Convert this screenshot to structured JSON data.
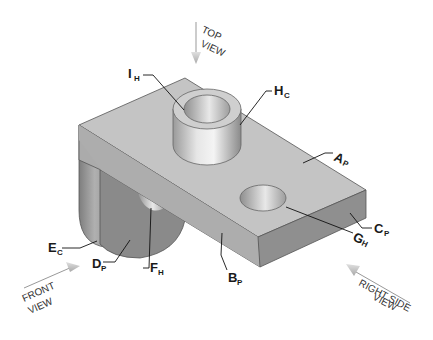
{
  "figure": {
    "view_arrows": {
      "top": {
        "line1": "TOP",
        "line2": "VIEW"
      },
      "front": {
        "line1": "FRONT",
        "line2": "VIEW"
      },
      "right_side": {
        "line1": "RIGHT SIDE",
        "line2": "VIEW"
      }
    },
    "labels": [
      {
        "id": "I_H",
        "main": "I",
        "sub": "H",
        "meaning": "inner hole of boss"
      },
      {
        "id": "H_C",
        "main": "H",
        "sub": "C",
        "meaning": "cylindrical boss surface"
      },
      {
        "id": "A_P",
        "main": "A",
        "sub": "P",
        "meaning": "top plane"
      },
      {
        "id": "C_P",
        "main": "C",
        "sub": "P",
        "meaning": "right end plane"
      },
      {
        "id": "G_H",
        "main": "G",
        "sub": "H",
        "meaning": "through hole"
      },
      {
        "id": "B_P",
        "main": "B",
        "sub": "P",
        "meaning": "front plane"
      },
      {
        "id": "E_C",
        "main": "E",
        "sub": "C",
        "meaning": "rounded cylinder surface"
      },
      {
        "id": "D_P",
        "main": "D",
        "sub": "P",
        "meaning": "lower front plane"
      },
      {
        "id": "F_H",
        "main": "F",
        "sub": "H",
        "meaning": "lower hole"
      }
    ],
    "colors": {
      "top_face": "#c4c4c4",
      "front_face": "#a9a9a9",
      "end_face": "#8f8f8f",
      "lower_face": "#8a8a8a",
      "arrow": "#bdbdbd"
    }
  }
}
